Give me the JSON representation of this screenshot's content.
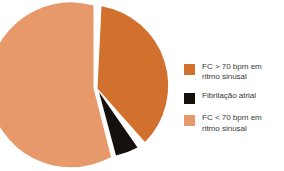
{
  "chart_data": {
    "type": "pie",
    "title": "",
    "subtitle": "",
    "xlabel": "",
    "ylabel": "",
    "grid": false,
    "legend_position": "right",
    "categories": [
      "FC > 70 bpm em ritmo sinusal",
      "Fibrilação atrial",
      "FC < 70 bpm em ritmo sinusal"
    ],
    "values": [
      37,
      3,
      60
    ],
    "colors": [
      "#d2702e",
      "#14100d",
      "#e8996b"
    ],
    "units": "percent",
    "exploded": true
  },
  "legend": {
    "items": [
      {
        "label": "FC > 70 bpm em\nritmo sinusal",
        "color": "#d2702e",
        "swatch_name": "legend-swatch-fc-above-70"
      },
      {
        "label": "Fibrilação atrial",
        "color": "#14100d",
        "swatch_name": "legend-swatch-fibrilacao-atrial"
      },
      {
        "label": "FC < 70 bpm em\nritmo sinusal",
        "color": "#e8996b",
        "swatch_name": "legend-swatch-fc-below-70"
      }
    ]
  },
  "pie": {
    "slices": [
      {
        "name": "fc-above-70-slice",
        "color": "#d2702e",
        "path": "M 97.5 88.5 L 101.5 6.2 A 80.5 80.5 0 0 1 145.0 142.0 Z"
      },
      {
        "name": "fibrilacao-atrial-slice",
        "color": "#14100d",
        "path": "M 99.0 92.0 L 137.5 147.5 A 80.5 80.5 0 0 1 116.0 155.5 Z"
      },
      {
        "name": "fc-below-70-slice",
        "color": "#e8996b",
        "path": "M 93.5 88.0 L 93.5 5.5 A 82.5 82.5 0 1 0 111.0 157.0 Z"
      }
    ]
  }
}
